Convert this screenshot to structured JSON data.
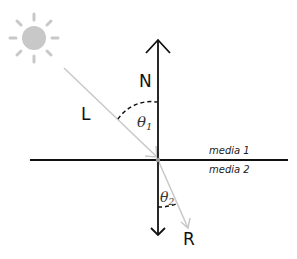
{
  "diagram": {
    "labels": {
      "normal": "N",
      "incident": "L",
      "reflected": "R",
      "theta1": "θ",
      "theta1_sub": "1",
      "theta2": "θ",
      "theta2_sub": "2",
      "media_top": "media 1",
      "media_bottom": "media 2"
    },
    "colors": {
      "line": "#111111",
      "ray": "#c8c8c8",
      "sun": "#c8c8c8",
      "point": "#999999"
    },
    "icons": {
      "light_source": "sun-icon"
    }
  }
}
